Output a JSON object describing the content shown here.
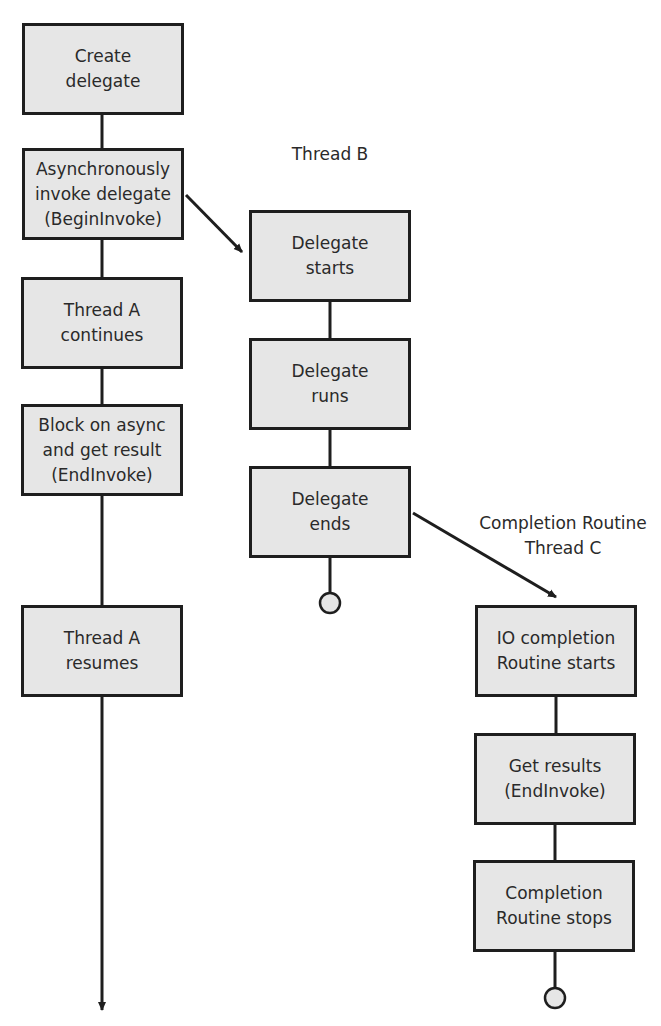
{
  "diagram": {
    "thread_a": {
      "steps": [
        {
          "id": "a1",
          "label": "Create\ndelegate"
        },
        {
          "id": "a2",
          "label": "Asynchronously\ninvoke delegate\n(BeginInvoke)"
        },
        {
          "id": "a3",
          "label": "Thread A\ncontinues"
        },
        {
          "id": "a4",
          "label": "Block on async\nand get result\n(EndInvoke)"
        },
        {
          "id": "a5",
          "label": "Thread A\nresumes"
        }
      ]
    },
    "thread_b": {
      "title": "Thread B",
      "steps": [
        {
          "id": "b1",
          "label": "Delegate\nstarts"
        },
        {
          "id": "b2",
          "label": "Delegate\nruns"
        },
        {
          "id": "b3",
          "label": "Delegate\nends"
        }
      ]
    },
    "thread_c": {
      "title": "Completion Routine\nThread C",
      "steps": [
        {
          "id": "c1",
          "label": "IO completion\nRoutine starts"
        },
        {
          "id": "c2",
          "label": "Get results\n(EndInvoke)"
        },
        {
          "id": "c3",
          "label": "Completion\nRoutine stops"
        }
      ]
    },
    "edges": [
      {
        "from": "a1",
        "to": "a2",
        "type": "line"
      },
      {
        "from": "a2",
        "to": "a3",
        "type": "line"
      },
      {
        "from": "a3",
        "to": "a4",
        "type": "line"
      },
      {
        "from": "a4",
        "to": "a5",
        "type": "line"
      },
      {
        "from": "a5",
        "to": "end-a",
        "type": "arrow"
      },
      {
        "from": "a2",
        "to": "b1",
        "type": "arrow"
      },
      {
        "from": "b1",
        "to": "b2",
        "type": "line"
      },
      {
        "from": "b2",
        "to": "b3",
        "type": "line"
      },
      {
        "from": "b3",
        "to": "end-b",
        "type": "terminator"
      },
      {
        "from": "b3",
        "to": "c1",
        "type": "arrow"
      },
      {
        "from": "c1",
        "to": "c2",
        "type": "line"
      },
      {
        "from": "c2",
        "to": "c3",
        "type": "line"
      },
      {
        "from": "c3",
        "to": "end-c",
        "type": "terminator"
      }
    ],
    "colors": {
      "box_fill": "#e6e6e6",
      "stroke": "#1e1e1e",
      "terminator_fill": "#e6e6e6"
    }
  }
}
